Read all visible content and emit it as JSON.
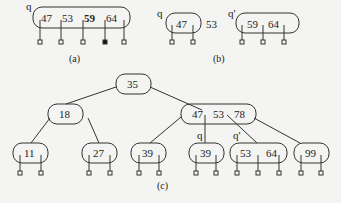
{
  "figure_a": {
    "pointer": "q",
    "keys": [
      "47",
      "53",
      "59",
      "64"
    ],
    "bold_key_index": 2,
    "caption": "(a)"
  },
  "figure_b": {
    "left": {
      "pointer": "q",
      "keys": [
        "47"
      ]
    },
    "promoted_key": "53",
    "right": {
      "pointer": "q'",
      "keys": [
        "59",
        "64"
      ]
    },
    "caption": "(b)"
  },
  "figure_c": {
    "root": {
      "keys": [
        "35"
      ]
    },
    "level1": [
      {
        "keys": [
          "18"
        ]
      },
      {
        "keys": [
          "47",
          "53",
          "78"
        ]
      }
    ],
    "leaves": [
      {
        "keys": [
          "11"
        ]
      },
      {
        "keys": [
          "27"
        ]
      },
      {
        "keys": [
          "39"
        ]
      },
      {
        "pointer": "q",
        "keys": [
          "39"
        ]
      },
      {
        "pointer": "q'",
        "keys": [
          "53",
          "64"
        ]
      },
      {
        "keys": [
          "99"
        ]
      }
    ],
    "caption": "(c)"
  }
}
